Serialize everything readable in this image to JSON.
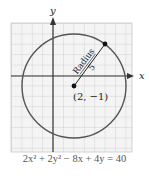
{
  "figure": {
    "axis_labels": {
      "x": "x",
      "y": "y"
    },
    "center": {
      "x": 2,
      "y": -1,
      "label": "(2, −1)"
    },
    "radius": {
      "value": 5,
      "label_word": "Radius",
      "label_value": "5"
    },
    "equation": "2x² + 2y² − 8x + 4y = 40",
    "colors": {
      "grid": "#c8c8c8",
      "grid_bg": "#f4f4f4",
      "circle": "#555555",
      "axis": "#333333",
      "text": "#222222"
    }
  }
}
